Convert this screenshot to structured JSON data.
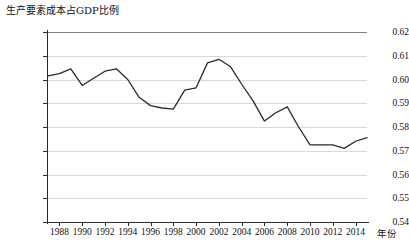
{
  "chart_data": {
    "type": "line",
    "title": "生产要素成本占GDP比例",
    "xlabel": "年份",
    "ylabel": "",
    "xlim": [
      1987,
      2015
    ],
    "ylim": [
      0.54,
      0.62
    ],
    "grid": true,
    "legend": "none",
    "y_ticks": [
      "0.62",
      "0.61",
      "0.60",
      "0.59",
      "0.58",
      "0.57",
      "0.56",
      "0.55",
      "0.54"
    ],
    "y_tick_values": [
      0.62,
      0.61,
      0.6,
      0.59,
      0.58,
      0.57,
      0.56,
      0.55,
      0.54
    ],
    "x_ticks": [
      "1988",
      "1990",
      "1992",
      "1994",
      "1996",
      "1998",
      "2000",
      "2002",
      "2004",
      "2006",
      "2008",
      "2010",
      "2012",
      "2014"
    ],
    "x_tick_values": [
      1988,
      1990,
      1992,
      1994,
      1996,
      1998,
      2000,
      2002,
      2004,
      2006,
      2008,
      2010,
      2012,
      2014
    ],
    "series": [
      {
        "name": "生产要素成本占GDP比例",
        "color": "#2b2b2b",
        "x": [
          1987,
          1988,
          1989,
          1990,
          1991,
          1992,
          1993,
          1994,
          1995,
          1996,
          1997,
          1998,
          1999,
          2000,
          2001,
          2002,
          2003,
          2004,
          2005,
          2006,
          2007,
          2008,
          2009,
          2010,
          2011,
          2012,
          2013,
          2014,
          2015
        ],
        "values": [
          0.6015,
          0.6025,
          0.6045,
          0.5975,
          0.6005,
          0.6035,
          0.6045,
          0.6,
          0.5925,
          0.589,
          0.588,
          0.5875,
          0.5955,
          0.5965,
          0.607,
          0.6085,
          0.6055,
          0.598,
          0.591,
          0.5825,
          0.586,
          0.5885,
          0.58,
          0.5725,
          0.5725,
          0.5725,
          0.571,
          0.574,
          0.5755
        ]
      }
    ]
  }
}
